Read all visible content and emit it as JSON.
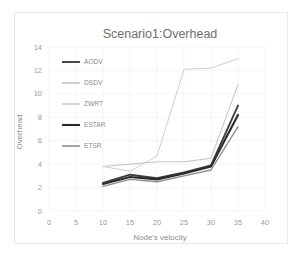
{
  "figure": {
    "title": "Scenario1:Overhead",
    "background_color": "#ffffff",
    "frame_color": "#e9e9e9"
  },
  "axes": {
    "x_label": "Node's velocity",
    "y_label": "Overhead",
    "x_ticks": [
      "0",
      "5",
      "10",
      "15",
      "20",
      "25",
      "30",
      "35",
      "40"
    ],
    "y_ticks": [
      "0",
      "2",
      "4",
      "6",
      "8",
      "10",
      "12",
      "14"
    ],
    "tick_color": "#9b9b9b",
    "gridline_color": "#f0f0f0"
  },
  "legend": {
    "position": "upper-left-inside",
    "items": [
      {
        "label": "AODV",
        "color": "#3f3f3f",
        "width": 1.9
      },
      {
        "label": "DSDV",
        "color": "#c2c2c2",
        "width": 1.0
      },
      {
        "label": "ZWRT",
        "color": "#cfcfcf",
        "width": 1.0
      },
      {
        "label": "ESTAR",
        "color": "#2b2b2b",
        "width": 2.1
      },
      {
        "label": "ETSR",
        "color": "#8e8e8e",
        "width": 1.4
      }
    ]
  },
  "chart_data": {
    "type": "line",
    "title": "Scenario1:Overhead",
    "xlabel": "Node's velocity",
    "ylabel": "Overhead",
    "xlim": [
      0,
      40
    ],
    "ylim": [
      0,
      14
    ],
    "x_ticks": [
      0,
      5,
      10,
      15,
      20,
      25,
      30,
      35,
      40
    ],
    "y_ticks": [
      0,
      2,
      4,
      6,
      8,
      10,
      12,
      14
    ],
    "grid": true,
    "legend_position": "upper-left",
    "x": [
      10,
      15,
      20,
      25,
      30,
      35
    ],
    "series": [
      {
        "name": "AODV",
        "color": "#3f3f3f",
        "width": 1.9,
        "values": [
          2.4,
          3.1,
          2.8,
          3.3,
          3.9,
          9.0
        ]
      },
      {
        "name": "DSDV",
        "color": "#c2c2c2",
        "width": 1.0,
        "values": [
          3.8,
          4.0,
          4.2,
          4.2,
          4.5,
          10.8
        ]
      },
      {
        "name": "ZWRT",
        "color": "#cfcfcf",
        "width": 1.0,
        "values": [
          3.8,
          3.4,
          4.7,
          12.1,
          12.2,
          13.0
        ]
      },
      {
        "name": "ESTAR",
        "color": "#2b2b2b",
        "width": 2.1,
        "values": [
          2.3,
          2.9,
          2.7,
          3.2,
          3.8,
          8.2
        ]
      },
      {
        "name": "ETSR",
        "color": "#8e8e8e",
        "width": 1.4,
        "values": [
          2.1,
          2.7,
          2.5,
          3.0,
          3.5,
          7.2
        ]
      }
    ]
  }
}
